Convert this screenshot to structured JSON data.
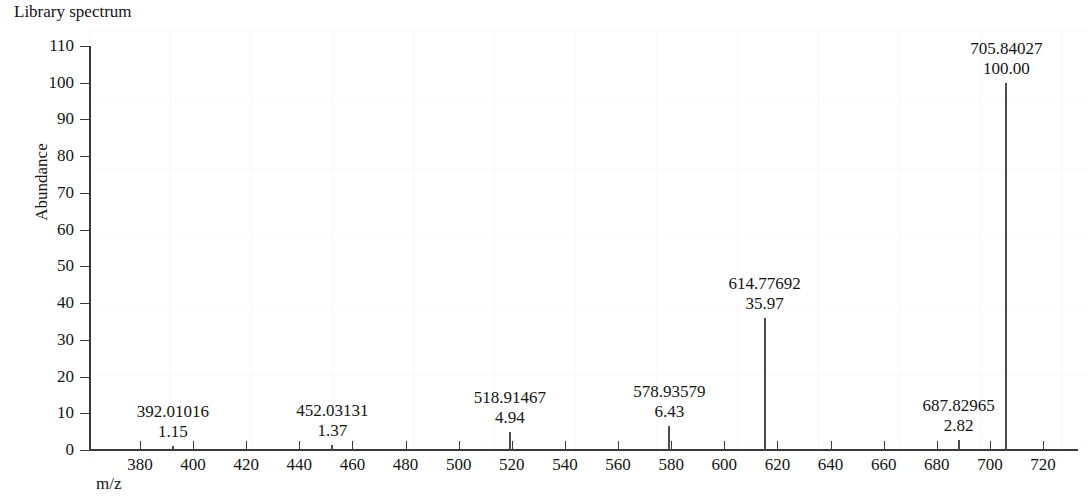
{
  "title": "Library spectrum",
  "axes": {
    "y_title": "Abundance",
    "x_title": "m/z",
    "y_ticks": [
      0,
      10,
      20,
      30,
      40,
      50,
      60,
      70,
      80,
      90,
      100,
      110
    ],
    "x_ticks": [
      380,
      400,
      420,
      440,
      460,
      480,
      500,
      520,
      540,
      560,
      580,
      600,
      620,
      640,
      660,
      680,
      700,
      720
    ]
  },
  "chart_data": {
    "type": "bar",
    "title": "Library spectrum",
    "subtitle": "",
    "xlabel": "m/z",
    "ylabel": "Abundance",
    "xlim": [
      360,
      740
    ],
    "ylim": [
      0,
      110
    ],
    "grid": false,
    "legend": "none",
    "x": [
      392.01016,
      452.03131,
      518.91467,
      578.93579,
      614.77692,
      687.82965,
      705.84027
    ],
    "values": [
      1.15,
      1.37,
      4.94,
      6.43,
      35.97,
      2.82,
      100.0
    ],
    "labels": [
      {
        "mz": "392.01016",
        "abundance": "1.15"
      },
      {
        "mz": "452.03131",
        "abundance": "1.37"
      },
      {
        "mz": "518.91467",
        "abundance": "4.94"
      },
      {
        "mz": "578.93579",
        "abundance": "6.43"
      },
      {
        "mz": "614.77692",
        "abundance": "35.97"
      },
      {
        "mz": "687.82965",
        "abundance": "2.82"
      },
      {
        "mz": "705.84027",
        "abundance": "100.00"
      }
    ]
  },
  "colors": {
    "peak": "#4c4c4c",
    "axis": "#3a3a3a",
    "text": "#141414",
    "background": "#ffffff"
  }
}
